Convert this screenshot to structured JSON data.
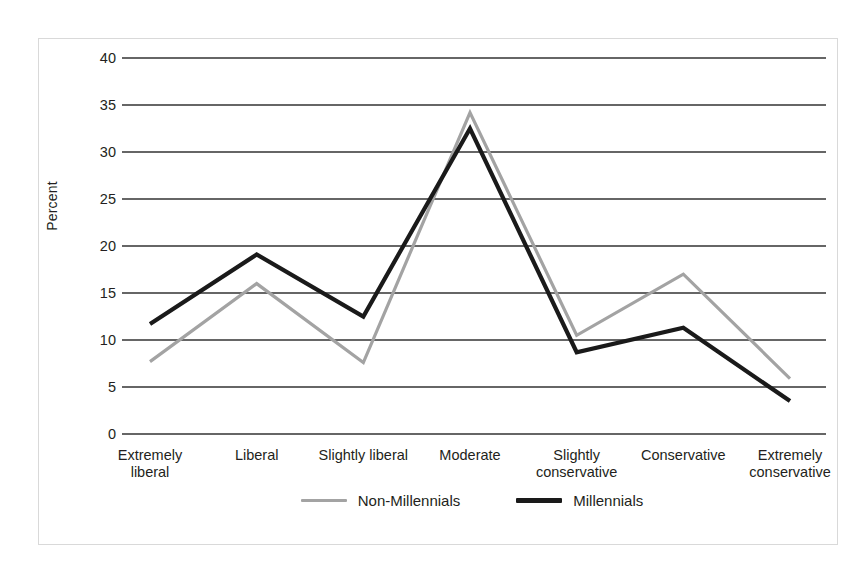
{
  "chart_data": {
    "type": "line",
    "title": "",
    "xlabel": "",
    "ylabel": "Percent",
    "ylim": [
      0,
      40
    ],
    "yticks": [
      0,
      5,
      10,
      15,
      20,
      25,
      30,
      35,
      40
    ],
    "grid": true,
    "legend_position": "bottom-center",
    "categories": [
      "Extremely liberal",
      "Liberal",
      "Slightly liberal",
      "Moderate",
      "Slightly conservative",
      "Conservative",
      "Extremely conservative"
    ],
    "category_lines": [
      [
        "Extremely",
        "liberal"
      ],
      [
        "Liberal"
      ],
      [
        "Slightly liberal"
      ],
      [
        "Moderate"
      ],
      [
        "Slightly",
        "conservative"
      ],
      [
        "Conservative"
      ],
      [
        "Extremely",
        "conservative"
      ]
    ],
    "series": [
      {
        "name": "Non-Millennials",
        "color": "#a3a3a3",
        "width": 3.2,
        "values": [
          7.7,
          16.0,
          7.6,
          34.2,
          10.5,
          17.0,
          5.9
        ]
      },
      {
        "name": "Millennials",
        "color": "#1a1a1a",
        "width": 4.2,
        "values": [
          11.7,
          19.1,
          12.5,
          32.5,
          8.7,
          11.3,
          3.5
        ]
      }
    ]
  },
  "axis": {
    "y_title": "Percent",
    "y_tick_labels": [
      "40",
      "35",
      "30",
      "25",
      "20",
      "15",
      "10",
      "5",
      "0"
    ]
  },
  "legend": {
    "entries": [
      {
        "label": "Non-Millennials",
        "color": "#a3a3a3"
      },
      {
        "label": "Millennials",
        "color": "#1a1a1a"
      }
    ]
  },
  "colors": {
    "non_millennials": "#a3a3a3",
    "millennials": "#1a1a1a",
    "gridline": "#333333",
    "frame": "#d9d9d9",
    "text": "#231f20"
  }
}
